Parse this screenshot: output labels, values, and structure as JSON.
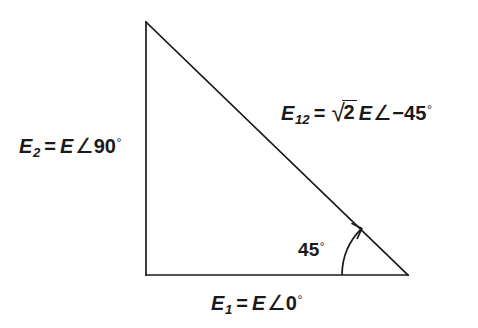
{
  "figure": {
    "type": "phasor-triangle-diagram",
    "background_color": "#ffffff",
    "line_color": "#1a1a1a",
    "text_color": "#1a1a1a"
  },
  "geometry": {
    "apex": {
      "x": 146,
      "y": 22
    },
    "corner_right_angle": {
      "x": 146,
      "y": 275
    },
    "vertex_45deg": {
      "x": 408,
      "y": 275
    },
    "vertical_leg_label_side": "left",
    "horizontal_leg_label_side": "bottom",
    "hypotenuse_label_side": "upper-right",
    "angle_arc": {
      "at_vertex": {
        "x": 408,
        "y": 275
      },
      "radius": 66,
      "start_deg": 180,
      "end_deg": 135,
      "has_arrowhead": true,
      "arrowhead_at": "hypotenuse-end"
    }
  },
  "labels": {
    "hypotenuse": {
      "name": "E",
      "subscript": "12",
      "equals": "=",
      "coefficient": "2",
      "radical_glyph": "√",
      "magnitude": "E",
      "angle_glyph": "∠",
      "sign": "−",
      "angle_value": "45",
      "degree_glyph": "°",
      "plain_text": "E12 = √2 E∠−45°"
    },
    "vertical_leg": {
      "name": "E",
      "subscript": "2",
      "equals": "=",
      "magnitude": "E",
      "angle_glyph": "∠",
      "angle_value": "90",
      "degree_glyph": "°",
      "plain_text": "E2 = E∠90°"
    },
    "horizontal_leg": {
      "name": "E",
      "subscript": "1",
      "equals": "=",
      "magnitude": "E",
      "angle_glyph": "∠",
      "angle_value": "0",
      "degree_glyph": "°",
      "plain_text": "E1 = E∠0°"
    },
    "interior_angle": {
      "value": "45",
      "degree_glyph": "°",
      "plain_text": "45°"
    }
  }
}
